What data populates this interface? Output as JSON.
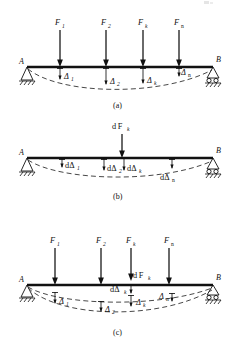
{
  "figure": {
    "panels": [
      {
        "id": "a",
        "caption": "(a)",
        "support_left_label": "A",
        "support_right_label": "B",
        "support_left_type": "pin",
        "support_right_type": "roller",
        "forces": [
          {
            "label": "F",
            "sub": "1",
            "x": 60
          },
          {
            "label": "F",
            "sub": "2",
            "x": 106
          },
          {
            "label": "F",
            "sub": "k",
            "x": 143
          },
          {
            "label": "F",
            "sub": "n",
            "x": 179
          }
        ],
        "deflections": [
          {
            "label": "Δ",
            "sub": "1",
            "x": 60
          },
          {
            "label": "Δ",
            "sub": "2",
            "x": 106
          },
          {
            "label": "Δ",
            "sub": "k",
            "x": 143
          },
          {
            "label": "Δ",
            "sub": "n",
            "x": 179
          }
        ]
      },
      {
        "id": "b",
        "caption": "(b)",
        "support_left_label": "A",
        "support_right_label": "B",
        "support_left_type": "pin",
        "support_right_type": "roller",
        "forces": [
          {
            "label": "d F",
            "sub": "k",
            "x": 122
          }
        ],
        "deflections": [
          {
            "label": "dΔ",
            "sub": "1",
            "x": 62
          },
          {
            "label": "dΔ",
            "sub": "2",
            "x": 104
          },
          {
            "label": "dΔ",
            "sub": "k",
            "x": 134
          },
          {
            "label": "dΔ",
            "sub": "n",
            "x": 172
          }
        ]
      },
      {
        "id": "c",
        "caption": "(c)",
        "support_left_label": "A",
        "support_right_label": "B",
        "support_left_type": "pin",
        "support_right_type": "roller",
        "forces": [
          {
            "label": "F",
            "sub": "1",
            "x": 55
          },
          {
            "label": "F",
            "sub": "2",
            "x": 101
          },
          {
            "label": "F",
            "sub": "k",
            "x": 131
          },
          {
            "label": "F",
            "sub": "n",
            "x": 169
          }
        ],
        "increment_force": {
          "label": "d F",
          "sub": "k",
          "x": 131
        },
        "increment_deflection": {
          "label": "dΔ",
          "sub": "k",
          "x": 131
        },
        "deflections": [
          {
            "label": "Δ",
            "sub": "1",
            "x": 55
          },
          {
            "label": "Δ",
            "sub": "2",
            "x": 101
          },
          {
            "label": "Δ",
            "sub": "k",
            "x": 134
          },
          {
            "label": "Δ",
            "sub": "n",
            "x": 163
          }
        ]
      }
    ],
    "colors": {
      "ink": "#111111",
      "dashed": "#333333",
      "background": "#ffffff"
    }
  }
}
